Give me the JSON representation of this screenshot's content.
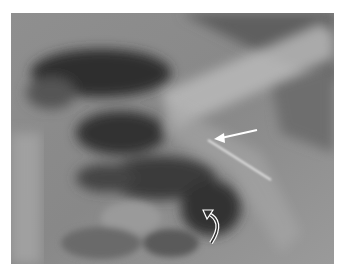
{
  "image": {
    "kind": "radiograph",
    "description": "Chest X-ray detail showing lung fields, clavicle and a thin linear radiopaque tube/line",
    "annotations": [
      {
        "type": "straight-arrow",
        "color": "#ffffff",
        "from": [
          257,
          130
        ],
        "to": [
          215,
          138
        ]
      },
      {
        "type": "curved-arrow",
        "color": "#ffffff",
        "tail": [
          213,
          243
        ],
        "tip": [
          205,
          213
        ]
      }
    ]
  },
  "colors": {
    "background": "#ffffff",
    "film_base": "#8a8a8a",
    "lung_dark": "#2a2a2a",
    "bone_light": "#c8c8c8",
    "arrow": "#ffffff"
  }
}
